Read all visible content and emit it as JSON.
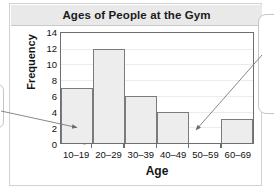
{
  "figure": {
    "title": "Ages of People at the Gym"
  },
  "chart_data": {
    "type": "bar",
    "title": "Ages of People at the Gym",
    "xlabel": "Age",
    "ylabel": "Frequency",
    "categories": [
      "10–19",
      "20–29",
      "30–39",
      "40–49",
      "50–59",
      "60–69"
    ],
    "values": [
      7,
      12,
      6,
      4,
      0,
      3
    ],
    "ylim": [
      0,
      14
    ],
    "ytick_step": 2,
    "yticks": [
      0,
      2,
      4,
      6,
      8,
      10,
      12,
      14
    ],
    "ytick_labels": [
      "0",
      "2",
      "4",
      "6",
      "8",
      "10",
      "12",
      "14"
    ],
    "grid": true,
    "legend": false,
    "bar_fill_color": "#ededee",
    "bar_edge_color": "#7b7b7d",
    "annotations": [
      {
        "name": "arrow-to-first-bin",
        "target_category": "10–19",
        "description": "arrow from left callout pointing to base of the 10-19 bar"
      },
      {
        "name": "arrow-to-empty-bin",
        "target_category": "50–59",
        "description": "arrow from right callout pointing to the empty 50-59 interval"
      }
    ]
  }
}
